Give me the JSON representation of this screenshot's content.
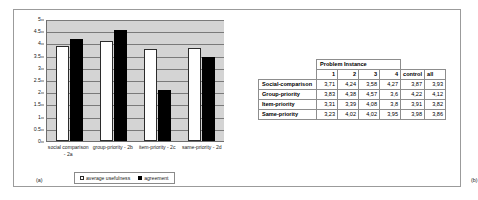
{
  "figure": {
    "panel_a_caption": "(a)",
    "panel_b_caption": "(b)"
  },
  "chart_data": {
    "type": "bar",
    "title": "",
    "xlabel": "",
    "ylabel": "",
    "ylim": [
      0,
      5
    ],
    "grid": true,
    "legend_position": "bottom",
    "categories": [
      "social comparison - 2a",
      "group-priority - 2b",
      "item-priority - 2c",
      "same-priority - 2d"
    ],
    "ytick_labels": [
      "5",
      "4.5",
      "4",
      "3.5",
      "3",
      "2.5",
      "2",
      "1.5",
      "1",
      "0.5",
      "0"
    ],
    "ytick_values": [
      5,
      4.5,
      4,
      3.5,
      3,
      2.5,
      2,
      1.5,
      1,
      0.5,
      0
    ],
    "series": [
      {
        "name": "average usefulness",
        "color": "#ffffff",
        "values": [
          3.93,
          4.12,
          3.82,
          3.86
        ]
      },
      {
        "name": "agreement",
        "color": "#000000",
        "values": [
          4.22,
          4.57,
          2.12,
          3.49
        ]
      }
    ]
  },
  "table": {
    "group_header": "Problem Instance",
    "column_headers": [
      "1",
      "2",
      "3",
      "4",
      "control",
      "all"
    ],
    "rows": [
      {
        "label": "Social-comparison",
        "values": [
          "3,71",
          "4,24",
          "3,58",
          "4,27",
          "3,87",
          "3,93"
        ]
      },
      {
        "label": "Group-priority",
        "values": [
          "3,83",
          "4,38",
          "4,57",
          "3,6",
          "4,22",
          "4,12"
        ]
      },
      {
        "label": "Item-priority",
        "values": [
          "3,31",
          "3,39",
          "4,08",
          "3,8",
          "3,91",
          "3,82"
        ]
      },
      {
        "label": "Same-priority",
        "values": [
          "3,23",
          "4,02",
          "4,02",
          "3,95",
          "3,98",
          "3,86"
        ]
      }
    ]
  }
}
